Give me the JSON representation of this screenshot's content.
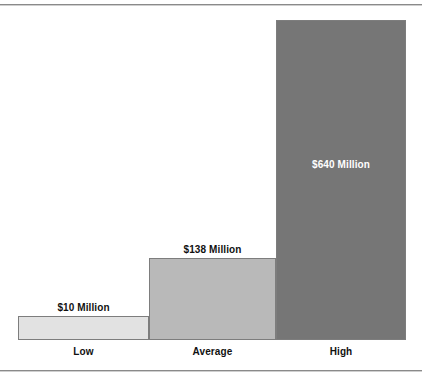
{
  "chart_data": {
    "type": "bar",
    "title": "",
    "subtitle": "",
    "xlabel": "",
    "ylabel": "",
    "grid": false,
    "legend": "none",
    "axis_tick_labels": [],
    "ylim": [
      0,
      640
    ],
    "categories": [
      "Low",
      "Average",
      "High"
    ],
    "values": [
      10,
      138,
      640
    ],
    "value_labels": [
      "$10 Million",
      "$138 Million",
      "$640 Million"
    ],
    "units": "Million USD",
    "bar_colors": [
      "#e2e2e2",
      "#b9b9b9",
      "#767676"
    ],
    "bar_border_color": "#7d7d7d",
    "label_text_colors": [
      "#111111",
      "#111111",
      "#ffffff"
    ],
    "bars": [
      {
        "category": "Low",
        "value": 10,
        "value_label": "$10 Million",
        "fill": "#e2e2e2",
        "label_position": "above"
      },
      {
        "category": "Average",
        "value": 138,
        "value_label": "$138 Million",
        "fill": "#b9b9b9",
        "label_position": "above"
      },
      {
        "category": "High",
        "value": 640,
        "value_label": "$640 Million",
        "fill": "#767676",
        "label_position": "inside"
      }
    ]
  },
  "rules": {
    "top_rule_color": "#8a8a8a",
    "bottom_rule_color": "#8a8a8a"
  }
}
